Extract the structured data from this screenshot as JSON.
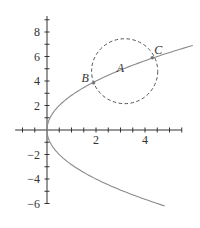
{
  "figure": {
    "colors": {
      "axis": "#333333",
      "curve": "#8a8a8a",
      "circle": "#555555",
      "point": "#777777",
      "text": "#333333"
    },
    "transform": {
      "origin_px": [
        47,
        130
      ],
      "x_scale": 24.5,
      "y_scale": 12.25
    },
    "x_axis": {
      "range": [
        -1.3,
        5.5
      ],
      "tick_step": 0.5,
      "tick_labels": [
        {
          "value": 2,
          "label": "2"
        },
        {
          "value": 4,
          "label": "4"
        }
      ]
    },
    "y_axis": {
      "range": [
        -6,
        9.3
      ],
      "tick_step": 1,
      "tick_labels": [
        {
          "value": 8,
          "label": "8"
        },
        {
          "value": 6,
          "label": "6"
        },
        {
          "value": 4,
          "label": "4"
        },
        {
          "value": 2,
          "label": "2"
        },
        {
          "value": -2,
          "label": "−2"
        },
        {
          "value": -4,
          "label": "−4"
        },
        {
          "value": -6,
          "label": "−6"
        }
      ]
    },
    "curve": {
      "equation": "y^2 = 8x",
      "y_range": [
        -6.2,
        6.9
      ],
      "style": "solid"
    },
    "circle": {
      "center": [
        3.17,
        4.8
      ],
      "radius_x_units": 1.35,
      "radius_y_units": 2.65,
      "style": "dashed"
    },
    "points": [
      {
        "name": "A",
        "label": "A",
        "x": 3.17,
        "y": 4.8,
        "marker": false,
        "label_offset": [
          -8,
          1
        ]
      },
      {
        "name": "B",
        "label": "B",
        "x": 1.9,
        "y": 3.85,
        "marker": true,
        "label_offset": [
          -12,
          -1
        ]
      },
      {
        "name": "C",
        "label": "C",
        "x": 4.3,
        "y": 5.9,
        "marker": true,
        "label_offset": [
          2,
          -4
        ]
      }
    ]
  }
}
